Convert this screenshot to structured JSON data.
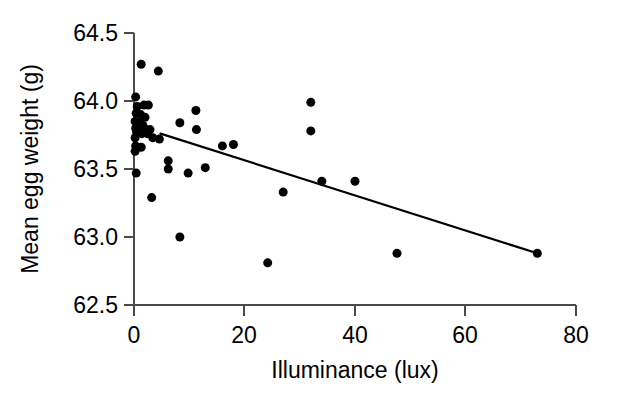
{
  "chart_data": {
    "type": "scatter",
    "title": "",
    "subtitle": "",
    "xlabel": "Illuminance (lux)",
    "ylabel": "Mean egg weight (g)",
    "xlim": [
      0,
      80
    ],
    "ylim": [
      62.5,
      64.5
    ],
    "xticks": [
      0,
      20,
      40,
      60,
      80
    ],
    "yticks": [
      62.5,
      63.0,
      63.5,
      64.0,
      64.5
    ],
    "xtick_labels": [
      "0",
      "20",
      "40",
      "60",
      "80"
    ],
    "ytick_labels": [
      "62.5",
      "63.0",
      "63.5",
      "64.0",
      "64.5"
    ],
    "grid": false,
    "legend": null,
    "marker": {
      "shape": "circle",
      "color": "#000000",
      "size_px": 9
    },
    "points": [
      {
        "x": 1.3,
        "y": 64.27
      },
      {
        "x": 4.4,
        "y": 64.22
      },
      {
        "x": 0.3,
        "y": 64.03
      },
      {
        "x": 0.6,
        "y": 63.96
      },
      {
        "x": 1.8,
        "y": 63.97
      },
      {
        "x": 2.6,
        "y": 63.97
      },
      {
        "x": 0.4,
        "y": 63.91
      },
      {
        "x": 1.2,
        "y": 63.9
      },
      {
        "x": 2.0,
        "y": 63.88
      },
      {
        "x": 0.2,
        "y": 63.85
      },
      {
        "x": 0.9,
        "y": 63.84
      },
      {
        "x": 1.6,
        "y": 63.82
      },
      {
        "x": 0.3,
        "y": 63.8
      },
      {
        "x": 1.1,
        "y": 63.8
      },
      {
        "x": 2.2,
        "y": 63.79
      },
      {
        "x": 2.9,
        "y": 63.79
      },
      {
        "x": 0.5,
        "y": 63.77
      },
      {
        "x": 1.4,
        "y": 63.76
      },
      {
        "x": 2.4,
        "y": 63.76
      },
      {
        "x": 0.2,
        "y": 63.73
      },
      {
        "x": 3.4,
        "y": 63.73
      },
      {
        "x": 4.6,
        "y": 63.72
      },
      {
        "x": 0.3,
        "y": 63.67
      },
      {
        "x": 1.3,
        "y": 63.66
      },
      {
        "x": 0.2,
        "y": 63.63
      },
      {
        "x": 0.4,
        "y": 63.47
      },
      {
        "x": 3.2,
        "y": 63.29
      },
      {
        "x": 6.2,
        "y": 63.56
      },
      {
        "x": 6.2,
        "y": 63.5
      },
      {
        "x": 8.3,
        "y": 63.84
      },
      {
        "x": 8.3,
        "y": 63.0
      },
      {
        "x": 9.8,
        "y": 63.47
      },
      {
        "x": 11.2,
        "y": 63.93
      },
      {
        "x": 11.3,
        "y": 63.79
      },
      {
        "x": 12.9,
        "y": 63.51
      },
      {
        "x": 16.0,
        "y": 63.67
      },
      {
        "x": 18.0,
        "y": 63.68
      },
      {
        "x": 24.2,
        "y": 62.81
      },
      {
        "x": 27.0,
        "y": 63.33
      },
      {
        "x": 32.0,
        "y": 63.99
      },
      {
        "x": 32.0,
        "y": 63.78
      },
      {
        "x": 34.0,
        "y": 63.41
      },
      {
        "x": 40.0,
        "y": 63.41
      },
      {
        "x": 47.6,
        "y": 62.88
      },
      {
        "x": 73.0,
        "y": 62.88
      }
    ],
    "trend_line": {
      "type": "linear-fit",
      "x_start": 4.8,
      "y_start": 63.76,
      "x_end": 73.0,
      "y_end": 62.88,
      "color": "#000000",
      "direction": "negative"
    }
  }
}
